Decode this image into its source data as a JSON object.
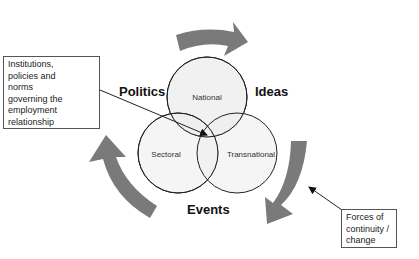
{
  "diagram": {
    "circles": [
      {
        "id": "national",
        "label": "National"
      },
      {
        "id": "sectoral",
        "label": "Sectoral"
      },
      {
        "id": "transnational",
        "label": "Transnational"
      }
    ],
    "forces": {
      "politics": "Politics",
      "ideas": "Ideas",
      "events": "Events"
    },
    "notes": {
      "institutions": {
        "lines": [
          "Institutions,",
          "policies and",
          "norms",
          "governing the",
          "employment",
          "relationship"
        ]
      },
      "forces": {
        "lines": [
          "Forces of",
          "continuity /",
          "change"
        ]
      }
    },
    "colors": {
      "arrow_fill": "#7a7a7a",
      "circle_fill": "#efefef",
      "circle_stroke": "#222222",
      "connector": "#222222"
    }
  }
}
